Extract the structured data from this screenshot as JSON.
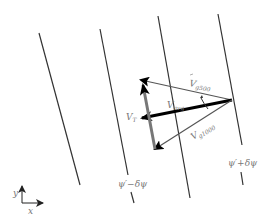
{
  "diagram": {
    "contours": {
      "left_label": "ψ′−δψ",
      "right_label": "ψ′+δψ"
    },
    "vectors": {
      "v_g500": {
        "label": "V",
        "subscript": "g500"
      },
      "v_avg": {
        "label": "V",
        "subscript": "avg"
      },
      "v_t": {
        "label": "V",
        "subscript": "T"
      },
      "v_g1000": {
        "label": "V",
        "subscript": "g1000"
      }
    },
    "axes": {
      "x": "x",
      "y": "y"
    },
    "colors": {
      "contour": "#333333",
      "thin_vector": "#555555",
      "avg_vector": "#111111",
      "thermal_vector": "#777777",
      "label": "#777777"
    }
  }
}
